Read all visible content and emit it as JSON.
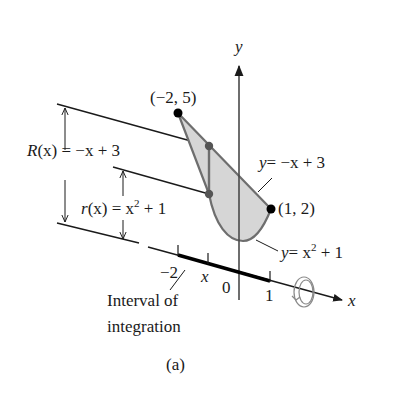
{
  "figure": {
    "caption": "(a)",
    "colors": {
      "region_fill": "#d6d6d6",
      "region_stroke": "#6e6e6e",
      "line": "#1a1a1a",
      "axis": "#4a4a4a",
      "point": "#000000",
      "mid_point": "#555555"
    }
  },
  "axes": {
    "y_label": "y",
    "x_label": "x",
    "ticks": [
      {
        "label": "−2"
      },
      {
        "label": "x"
      },
      {
        "label": "0"
      },
      {
        "label": "1"
      }
    ]
  },
  "points": {
    "p1": {
      "label": "(−2, 5)"
    },
    "p2": {
      "label": "(1, 2)"
    }
  },
  "curves": {
    "upper": {
      "label_y": "y",
      "label_eq": "= −x + 3"
    },
    "lower": {
      "label_y": "y",
      "label_eq_a": "= x",
      "label_exp": "2",
      "label_eq_b": " + 1"
    }
  },
  "radii": {
    "outer": {
      "name": "R",
      "arg": "(x)",
      "eq": " = −x + 3"
    },
    "inner": {
      "name": "r",
      "arg": "(x)",
      "eq_a": " = x",
      "exp": "2",
      "eq_b": " + 1"
    }
  },
  "annotations": {
    "interval_line1": "Interval of",
    "interval_line2": "integration"
  }
}
